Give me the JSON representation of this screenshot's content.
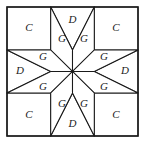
{
  "figure": {
    "name": "eight-pointed-star-quilt-block",
    "canvas": {
      "width": 146,
      "height": 145
    },
    "frame": {
      "x": 7,
      "y": 7,
      "width": 131,
      "height": 129,
      "stroke": "#1a1a1a"
    },
    "grid": {
      "rows": 3,
      "cols": 3,
      "x_thirds": [
        7,
        50.7,
        94.3,
        138
      ],
      "y_thirds": [
        7,
        50,
        93,
        136
      ]
    },
    "center": {
      "x": 72.5,
      "y": 71.5
    },
    "colors": {
      "line": "#1a1a1a",
      "fill": "#ffffff",
      "background": "#ffffff"
    },
    "labels": {
      "corner": "C",
      "edge": "D",
      "star_point": "G"
    },
    "pieces": [
      {
        "id": "corner-top-left",
        "label": "C",
        "label_x": 29,
        "label_y": 28
      },
      {
        "id": "corner-top-right",
        "label": "C",
        "label_x": 116,
        "label_y": 28
      },
      {
        "id": "corner-bottom-left",
        "label": "C",
        "label_x": 29,
        "label_y": 115
      },
      {
        "id": "corner-bottom-right",
        "label": "C",
        "label_x": 116,
        "label_y": 115
      },
      {
        "id": "edge-top",
        "label": "D",
        "label_x": 72.5,
        "label_y": 20
      },
      {
        "id": "edge-left",
        "label": "D",
        "label_x": 20,
        "label_y": 71.5
      },
      {
        "id": "edge-right",
        "label": "D",
        "label_x": 125,
        "label_y": 71.5
      },
      {
        "id": "edge-bottom",
        "label": "D",
        "label_x": 72.5,
        "label_y": 124
      },
      {
        "id": "star-point-n-left",
        "label": "G",
        "label_x": 62,
        "label_y": 39
      },
      {
        "id": "star-point-n-right",
        "label": "G",
        "label_x": 84,
        "label_y": 39
      },
      {
        "id": "star-point-w-upper",
        "label": "G",
        "label_x": 43,
        "label_y": 57
      },
      {
        "id": "star-point-w-lower",
        "label": "G",
        "label_x": 43,
        "label_y": 87
      },
      {
        "id": "star-point-e-upper",
        "label": "G",
        "label_x": 104,
        "label_y": 57
      },
      {
        "id": "star-point-e-lower",
        "label": "G",
        "label_x": 104,
        "label_y": 87
      },
      {
        "id": "star-point-s-left",
        "label": "G",
        "label_x": 62,
        "label_y": 104
      },
      {
        "id": "star-point-s-right",
        "label": "G",
        "label_x": 84,
        "label_y": 104
      }
    ]
  }
}
